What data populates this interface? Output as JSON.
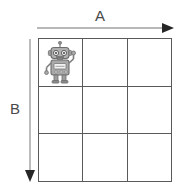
{
  "figure": {
    "type": "grid-diagram",
    "background_color": "#ffffff",
    "grid": {
      "rows": 3,
      "columns": 3,
      "line_color": "#5a5a5a",
      "cell_fill": "#ffffff",
      "cells": [
        [
          {
            "id": "r1c1",
            "content": "robot"
          },
          {
            "id": "r1c2",
            "content": ""
          },
          {
            "id": "r1c3",
            "content": ""
          }
        ],
        [
          {
            "id": "r2c1",
            "content": ""
          },
          {
            "id": "r2c2",
            "content": ""
          },
          {
            "id": "r2c3",
            "content": ""
          }
        ],
        [
          {
            "id": "r3c1",
            "content": ""
          },
          {
            "id": "r3c2",
            "content": ""
          },
          {
            "id": "r3c3",
            "content": ""
          }
        ]
      ]
    },
    "axes": {
      "horizontal": {
        "label": "A",
        "direction": "right",
        "color": "#8a8a8a",
        "arrowhead_color": "#222222"
      },
      "vertical": {
        "label": "B",
        "direction": "down",
        "color": "#8a8a8a",
        "arrowhead_color": "#222222"
      }
    },
    "figure_object": {
      "name": "robot",
      "icon": "robot-icon",
      "position": {
        "row": 1,
        "column": 1
      },
      "body_color": "#a6a6a6",
      "outline_color": "#6e6e6e",
      "panel_color": "#f2f2f2",
      "raised_arm": "right"
    }
  }
}
